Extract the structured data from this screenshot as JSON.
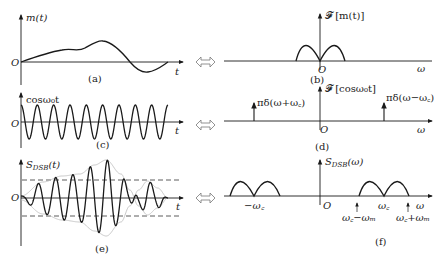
{
  "figure": {
    "panels": [
      {
        "id": "a",
        "caption": "(a)",
        "ylabel": "m(t)",
        "origin": "O",
        "xlabel": "t",
        "description": "Baseband message signal m(t)"
      },
      {
        "id": "b",
        "caption": "(b)",
        "ylabel": "𝓕 [m(t)]",
        "origin": "O",
        "xlabel": "ω",
        "description": "Spectrum of message, two humps centered at 0"
      },
      {
        "id": "c",
        "caption": "(c)",
        "ylabel": "cosω₀t",
        "origin": "O",
        "xlabel": "t",
        "description": "Carrier cosine"
      },
      {
        "id": "d",
        "caption": "(d)",
        "ylabel": "𝓕 [cosω₀t]",
        "origin": "O",
        "xlabel": "ω",
        "left_impulse": "πδ(ω+ω꜀)",
        "right_impulse": "πδ(ω−ω꜀)",
        "description": "Carrier spectrum: impulses at ±ω꜀"
      },
      {
        "id": "e",
        "caption": "(e)",
        "ylabel": "S_DSB(t)",
        "ylabel_main": "S",
        "ylabel_sub": "DSB",
        "ylabel_arg": "(t)",
        "origin": "O",
        "xlabel": "t",
        "description": "DSB modulated signal with envelope ±m(t)"
      },
      {
        "id": "f",
        "caption": "(f)",
        "ylabel_main": "S",
        "ylabel_sub": "DSB",
        "ylabel_arg": "(ω)",
        "origin": "O",
        "xlabel": "ω",
        "tick_neg_wc": "−ω꜀",
        "tick_wc": "ω꜀",
        "tick_wc_minus_wm": "ω꜀−ωₘ",
        "tick_wc_plus_wm": "ω꜀+ωₘ",
        "description": "DSB spectrum shifted to ±ω꜀"
      }
    ],
    "transform_arrow": "⇔"
  },
  "colors": {
    "line": "#1a1a1a",
    "envelope": "#bdbdbd",
    "dashed": "#333333"
  }
}
